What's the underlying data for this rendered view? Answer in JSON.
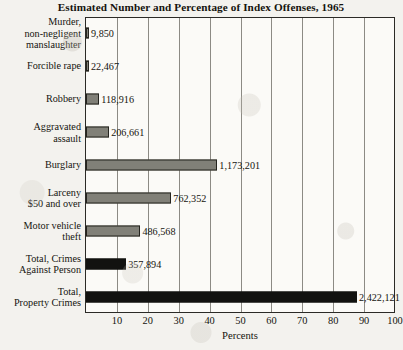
{
  "chart_data": {
    "type": "bar",
    "orientation": "horizontal",
    "title": "Estimated Number and Percentage of Index Offenses, 1965",
    "xlabel": "Percents",
    "ylabel": "",
    "xlim": [
      0,
      100
    ],
    "xticks": [
      0,
      10,
      20,
      30,
      40,
      50,
      60,
      70,
      80,
      90,
      100
    ],
    "xtick_labels": [
      "",
      "10",
      "20",
      "30",
      "40",
      "50",
      "60",
      "70",
      "80",
      "90",
      "100"
    ],
    "grid": true,
    "grid_axis": "x",
    "legend": "none",
    "categories": [
      "Murder,\nnon-negligent\nmanslaughter",
      "Forcible rape",
      "Robbery",
      "Aggravated\nassault",
      "Burglary",
      "Larceny\n$50 and over",
      "Motor vehicle\ntheft",
      "Total, Crimes\nAgainst Person",
      "Total,\nProperty Crimes"
    ],
    "values": [
      0.4,
      0.8,
      4.3,
      7.5,
      42.5,
      27.6,
      17.6,
      13.0,
      87.7
    ],
    "value_labels": [
      "9,850",
      "22,467",
      "118,916",
      "206,661",
      "1,173,201",
      "762,352",
      "486,568",
      "357,894",
      "2,422,121"
    ],
    "counts": [
      9850,
      22467,
      118916,
      206661,
      1173201,
      762352,
      486568,
      357894,
      2422121
    ],
    "bar_styles": [
      "gray",
      "gray",
      "gray",
      "gray",
      "gray",
      "gray",
      "gray",
      "black",
      "black"
    ],
    "colors": {
      "gray_bar": "#818078",
      "black_bar": "#121210",
      "bar_outline": "#25241f",
      "plot_background": "#fbfaf7",
      "page_background": "#f3f2ee",
      "gridline": "#8c8a84",
      "axis": "#2b2a26",
      "text": "#15140f"
    }
  }
}
